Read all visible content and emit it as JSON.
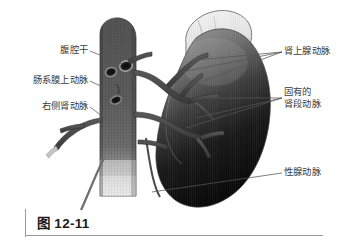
{
  "figure": {
    "caption": "图 12-11",
    "background_color": "#ffffff",
    "label_color": "#3b3b3b",
    "rule_color": "#9a9a9a"
  },
  "labels": {
    "left": [
      {
        "id": "celiac",
        "text": "腹腔干",
        "name": "label-celiac-trunk"
      },
      {
        "id": "sma",
        "text": "肠系膜上动脉",
        "name": "label-superior-mesenteric-artery"
      },
      {
        "id": "renal",
        "text": "右侧肾动脉",
        "name": "label-right-renal-artery"
      }
    ],
    "right": [
      {
        "id": "adrenal",
        "text": "肾上腺动脉",
        "name": "label-adrenal-artery"
      },
      {
        "id": "segmental",
        "line1": "固有的",
        "line2": "肾段动脉",
        "name": "label-proper-renal-segmental-artery"
      },
      {
        "id": "gonadal",
        "text": "性腺动脉",
        "name": "label-gonadal-artery"
      }
    ]
  },
  "structures": {
    "aorta": {
      "name": "abdominal-aorta",
      "fill_top": "#5d5d5d",
      "fill_bottom": "#b9b9b9",
      "texture": "cross-hatched"
    },
    "adrenal_gland": {
      "name": "adrenal-gland",
      "fill": "#ececec",
      "outline": "#6e6e6e",
      "texture": "fine-vertical-striations"
    },
    "kidney": {
      "name": "kidney",
      "fill_top": "#8a8a8a",
      "fill_bottom": "#0b0b0b",
      "texture": "fine-vertical-striations"
    },
    "arteries": {
      "name": "renal-artery-tree",
      "fill": "#4a4a4a",
      "outline": "#2a2a2a"
    },
    "ostia": {
      "name": "aortic-ostia",
      "count": 4,
      "fill": "#2a2a2a"
    }
  }
}
